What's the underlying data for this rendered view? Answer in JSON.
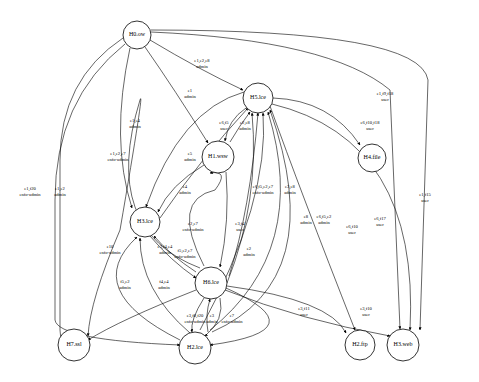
{
  "nodes": [
    {
      "id": "H0",
      "label": "H0.ow",
      "x": 137,
      "y": 35,
      "r": 14
    },
    {
      "id": "H5",
      "label": "H5.lce",
      "x": 258,
      "y": 98,
      "r": 15
    },
    {
      "id": "H1",
      "label": "H1.wsw",
      "x": 218,
      "y": 157,
      "r": 16
    },
    {
      "id": "H4",
      "label": "H4.file",
      "x": 372,
      "y": 158,
      "r": 14
    },
    {
      "id": "H3",
      "label": "H3.lce",
      "x": 145,
      "y": 222,
      "r": 15
    },
    {
      "id": "H6",
      "label": "H6.lce",
      "x": 211,
      "y": 283,
      "r": 16
    },
    {
      "id": "H7",
      "label": "H7.ssl",
      "x": 74,
      "y": 345,
      "r": 16
    },
    {
      "id": "H2",
      "label": "H2.lce",
      "x": 195,
      "y": 348,
      "r": 16
    },
    {
      "id": "H8",
      "label": "H2.ftp",
      "x": 360,
      "y": 345,
      "r": 15
    },
    {
      "id": "H9",
      "label": "H3.web",
      "x": 403,
      "y": 345,
      "r": 16
    }
  ],
  "edges": [
    {
      "path": "M150,40 Q200,70 243,90",
      "label": [
        "e1,e2,e8",
        "admin"
      ],
      "lx": 202,
      "ly": 62
    },
    {
      "path": "M145,47 Q175,90 208,143",
      "label": [
        "e1",
        "admin"
      ],
      "lx": 190,
      "ly": 92
    },
    {
      "path": "M130,48 Q110,140 132,208",
      "label": [
        "e1,e4",
        "admin"
      ],
      "lx": 135,
      "ly": 122
    },
    {
      "path": "M123,38 Q60,80 60,160 L60,330 Q62,345 58,345",
      "label": [
        "e1,f20",
        "enfo-admin"
      ],
      "lx": 30,
      "ly": 190
    },
    {
      "path": "M125,44 Q55,100 55,200 L55,320 Q58,340 180,345",
      "label": [
        "e1,e2",
        "admin"
      ],
      "lx": 60,
      "ly": 190
    },
    {
      "path": "M151,32 Q330,40 390,90 L400,329",
      "label": [
        "e1,f9,f18",
        "user"
      ],
      "lx": 385,
      "ly": 95
    },
    {
      "path": "M151,30 Q420,30 428,80 L420,330",
      "label": [
        "e1,f15",
        "user"
      ],
      "lx": 425,
      "ly": 196
    },
    {
      "path": "M244,92 Q180,110 146,207",
      "label": [
        "e1,e2,e7",
        "enfo-admin"
      ],
      "lx": 118,
      "ly": 155
    },
    {
      "path": "M273,98 Q330,100 360,145",
      "label": [
        "e6,f10,f18",
        "user"
      ],
      "lx": 370,
      "ly": 124
    },
    {
      "path": "M270,106 Q300,190 355,330",
      "label": [
        "e6,f10",
        "user"
      ],
      "lx": 352,
      "ly": 228
    },
    {
      "path": "M272,104 Q420,140 410,330",
      "label": [
        "e6,f17",
        "user"
      ],
      "lx": 380,
      "ly": 220
    },
    {
      "path": "M246,108 Q228,120 225,141",
      "label": [
        "e6,f5",
        "user"
      ],
      "lx": 224,
      "ly": 124
    },
    {
      "path": "M230,142 Q240,125 250,112",
      "label": [
        "e2,e8",
        "admin"
      ],
      "lx": 245,
      "ly": 124
    },
    {
      "path": "M204,165 Q170,185 158,212",
      "label": [
        "e4",
        "admin"
      ],
      "lx": 185,
      "ly": 188
    },
    {
      "path": "M226,172 Q230,220 220,267",
      "label": [
        "e3,f4",
        "user"
      ],
      "lx": 240,
      "ly": 225
    },
    {
      "path": "M204,266 Q170,200 215,190 Q230,170 210,173",
      "label": [
        "e2,e7",
        "enfo-admin"
      ],
      "lx": 193,
      "ly": 225
    },
    {
      "path": "M160,218 Q200,160 248,108",
      "label": [
        "e5",
        "admin"
      ],
      "lx": 190,
      "ly": 155
    },
    {
      "path": "M150,236 Q170,260 196,278",
      "label": [
        "e3,f4,e4",
        "admin"
      ],
      "lx": 165,
      "ly": 248
    },
    {
      "path": "M196,272 Q170,255 154,236",
      "label": [
        "f5,e2,e7",
        "enfo-admin"
      ],
      "lx": 185,
      "ly": 252
    },
    {
      "path": "M227,283 Q260,200 252,113",
      "label": [
        "e6,f5,e2,e7",
        "enfo-admin"
      ],
      "lx": 263,
      "ly": 188
    },
    {
      "path": "M229,276 Q250,210 258,113",
      "label": [
        "e2",
        "admin"
      ],
      "lx": 249,
      "ly": 250
    },
    {
      "path": "M200,330 Q270,200 263,113",
      "label": [
        "e3,e8",
        "admin"
      ],
      "lx": 290,
      "ly": 188
    },
    {
      "path": "M210,330 Q310,250 268,112",
      "label": [
        "e8",
        "admin"
      ],
      "lx": 306,
      "ly": 218
    },
    {
      "path": "M212,332 Q330,280 270,110",
      "label": [
        "e6,f5,e2",
        "admin"
      ],
      "lx": 324,
      "ly": 218
    },
    {
      "path": "M180,340 Q80,290 137,237",
      "label": [
        "f5,e2",
        "admin"
      ],
      "lx": 125,
      "ly": 283
    },
    {
      "path": "M190,333 Q140,290 140,238",
      "label": [
        "f4,e4",
        "admin"
      ],
      "lx": 164,
      "ly": 283
    },
    {
      "path": "M200,268 Q100,230 140,100 Q145,85 120,230 Q90,300 88,336",
      "label": [
        "e10",
        "enfo-admin"
      ],
      "lx": 110,
      "ly": 248
    },
    {
      "path": "M196,290 Q120,320 88,340",
      "label": [],
      "lx": 0,
      "ly": 0
    },
    {
      "path": "M204,298 Q190,320 192,332",
      "label": [
        "e3,f8,f20",
        "enfo-admin"
      ],
      "lx": 195,
      "ly": 317
    },
    {
      "path": "M208,332 Q205,315 210,299",
      "label": [
        "e3",
        "admin"
      ],
      "lx": 212,
      "ly": 317
    },
    {
      "path": "M220,298 Q225,320 205,336",
      "label": [
        "e7",
        "enfo-admin"
      ],
      "lx": 232,
      "ly": 317
    },
    {
      "path": "M227,286 Q330,300 346,333",
      "label": [
        "e3,f10",
        "user"
      ],
      "lx": 366,
      "ly": 310
    },
    {
      "path": "M225,290 Q300,320 390,336",
      "label": [
        "e3,f11",
        "user"
      ],
      "lx": 304,
      "ly": 310
    },
    {
      "path": "M226,288 Q320,330 210,345",
      "label": [],
      "lx": 0,
      "ly": 0
    }
  ]
}
